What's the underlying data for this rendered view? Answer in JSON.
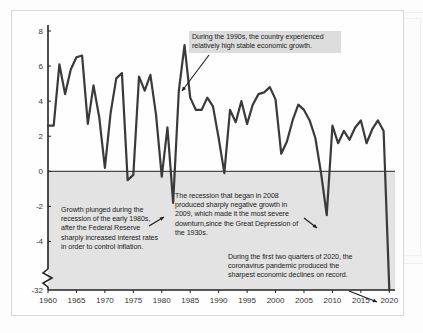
{
  "chart_data": {
    "type": "line",
    "title": "",
    "xlabel": "",
    "ylabel": "",
    "xlim": [
      1960,
      2021
    ],
    "ylim": [
      -32,
      8
    ],
    "grid": false,
    "legend": "none",
    "axis_break": {
      "between": [
        -4,
        -32
      ],
      "label_low": "-32"
    },
    "y_ticks": [
      "8",
      "6",
      "4",
      "2",
      "0",
      "-2",
      "-4",
      "-32"
    ],
    "y_tick_values": [
      8,
      6,
      4,
      2,
      0,
      -2,
      -4,
      -32
    ],
    "x_ticks": [
      "1960",
      "1965",
      "1970",
      "1975",
      "1980",
      "1985",
      "1990",
      "1995",
      "2000",
      "2005",
      "2010",
      "2015",
      "2020"
    ],
    "x_tick_values": [
      1960,
      1965,
      1970,
      1975,
      1980,
      1985,
      1990,
      1995,
      2000,
      2005,
      2010,
      2015,
      2020
    ],
    "series_name": "Real GDP growth rate (percent)",
    "line_color": "#3a3a3a",
    "below_zero_shading": "#e3e3e3",
    "x": [
      1960,
      1961,
      1962,
      1963,
      1964,
      1965,
      1966,
      1967,
      1968,
      1969,
      1970,
      1971,
      1972,
      1973,
      1974,
      1975,
      1976,
      1977,
      1978,
      1979,
      1980,
      1981,
      1982,
      1983,
      1984,
      1985,
      1986,
      1987,
      1988,
      1989,
      1990,
      1991,
      1992,
      1993,
      1994,
      1995,
      1996,
      1997,
      1998,
      1999,
      2000,
      2001,
      2002,
      2003,
      2004,
      2005,
      2006,
      2007,
      2008,
      2009,
      2010,
      2011,
      2012,
      2013,
      2014,
      2015,
      2016,
      2017,
      2018,
      2019,
      2020
    ],
    "values": [
      2.6,
      2.6,
      6.1,
      4.4,
      5.8,
      6.5,
      6.6,
      2.7,
      4.9,
      3.1,
      0.2,
      3.3,
      5.3,
      5.6,
      -0.5,
      -0.2,
      5.4,
      4.6,
      5.5,
      3.2,
      -0.3,
      2.5,
      -1.8,
      4.6,
      7.2,
      4.2,
      3.5,
      3.5,
      4.2,
      3.7,
      1.9,
      -0.1,
      3.5,
      2.8,
      4.0,
      2.7,
      3.8,
      4.4,
      4.5,
      4.8,
      4.1,
      1.0,
      1.7,
      2.9,
      3.8,
      3.5,
      2.9,
      1.9,
      -0.1,
      -2.5,
      2.6,
      1.6,
      2.3,
      1.8,
      2.5,
      2.9,
      1.6,
      2.4,
      2.9,
      2.3,
      -32.0
    ],
    "annotations": [
      {
        "id": "callout-1990s",
        "text": "During the 1990s, the country experienced relatively high stable economic growth.",
        "points_to_year": 1998,
        "points_to_value": 4.6
      },
      {
        "id": "callout-1980s",
        "text": "Growth plunged during the recession of the early 1980s, after the Federal Reserve sharply increased interest rates in order to control inflation.",
        "points_to_year": 1982,
        "points_to_value": -1.8
      },
      {
        "id": "callout-2008",
        "text": "The recession that began in 2008 produced sharply negative growth in 2009, which made it the most severe downturn,since the Great Depression of the 1930s.",
        "points_to_year": 2009,
        "points_to_value": -2.5
      },
      {
        "id": "callout-2020",
        "text": "During the first two quarters of 2020, the coronavirus pandemic produced the sharpest economic declines on record.",
        "points_to_year": 2020,
        "points_to_value": -32.0
      }
    ]
  }
}
